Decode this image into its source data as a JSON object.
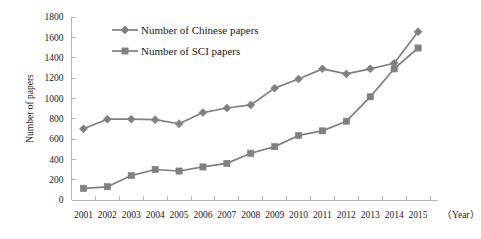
{
  "chart_data": {
    "type": "line",
    "title": "",
    "xlabel": "（Year）",
    "ylabel": "Number of papers",
    "categories": [
      "2001",
      "2002",
      "2003",
      "2004",
      "2005",
      "2006",
      "2007",
      "2008",
      "2009",
      "2010",
      "2011",
      "2012",
      "2013",
      "2014",
      "2015"
    ],
    "ylim": [
      0,
      1800
    ],
    "ytick_step": 200,
    "yticks": [
      "0",
      "200",
      "400",
      "600",
      "800",
      "1000",
      "1200",
      "1400",
      "1600",
      "1800"
    ],
    "grid": false,
    "legend_position": "top-left-inside",
    "series": [
      {
        "name": "Number of Chinese papers",
        "marker": "diamond",
        "color": "#808080",
        "values": [
          700,
          795,
          795,
          790,
          750,
          860,
          905,
          935,
          1100,
          1190,
          1290,
          1240,
          1290,
          1345,
          1655
        ]
      },
      {
        "name": "Number of SCI papers",
        "marker": "square",
        "color": "#808080",
        "values": [
          115,
          130,
          240,
          300,
          285,
          325,
          360,
          460,
          525,
          635,
          680,
          775,
          1015,
          1290,
          1495
        ]
      }
    ]
  },
  "axis": {
    "y_title": "Number of papers",
    "x_title": "（Year）"
  }
}
